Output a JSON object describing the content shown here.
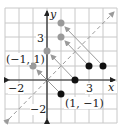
{
  "diagram": {
    "axes": {
      "x_label": "x",
      "y_label": "y",
      "x_range": [
        -3,
        5
      ],
      "y_range": [
        -3,
        5
      ],
      "x_tick_labels": [
        {
          "value": -2,
          "text": "−2"
        },
        {
          "value": 3,
          "text": "3"
        }
      ],
      "y_tick_labels": [
        {
          "value": 3,
          "text": "3"
        },
        {
          "value": -2,
          "text": "−2"
        }
      ]
    },
    "reference_line": {
      "equation": "y = x",
      "style": "dashed",
      "color": "#9a9a9a"
    },
    "original_points": [
      {
        "x": 1,
        "y": -1
      },
      {
        "x": 2,
        "y": 0
      },
      {
        "x": 3,
        "y": 1
      },
      {
        "x": 4,
        "y": 1
      }
    ],
    "reflected_points": [
      {
        "x": -1,
        "y": 1
      },
      {
        "x": 0,
        "y": 2
      },
      {
        "x": 1,
        "y": 3
      },
      {
        "x": 1,
        "y": 4
      }
    ],
    "point_labels": [
      {
        "text": "(−1, 1)",
        "x": -1,
        "y": 1
      },
      {
        "text": "(1, −1)",
        "x": 1,
        "y": -1
      }
    ],
    "colors": {
      "original": "#111111",
      "reflected": "#9a9a9a",
      "grid": "#c8c8c8",
      "axis": "#222222",
      "arrow": "#9a9a9a"
    }
  }
}
